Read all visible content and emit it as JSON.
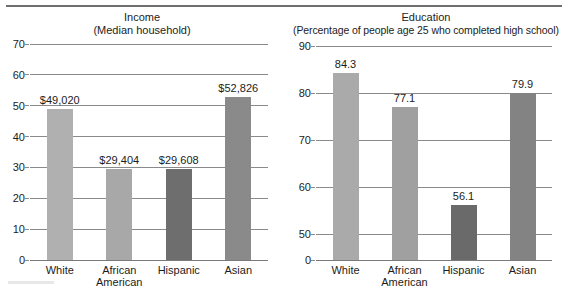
{
  "figure": {
    "top_rule": true,
    "panels": [
      "income",
      "education"
    ]
  },
  "income": {
    "title_line1": "Income",
    "title_line2": "(Median household)",
    "y_ticks": [
      "0",
      "10",
      "20",
      "30",
      "40",
      "50",
      "60",
      "70"
    ],
    "categories": [
      "White",
      "African American",
      "Hispanic",
      "Asian"
    ],
    "category_lines": [
      [
        "White"
      ],
      [
        "African",
        "American"
      ],
      [
        "Hispanic"
      ],
      [
        "Asian"
      ]
    ],
    "bar_labels": [
      "$49,020",
      "$29,404",
      "$29,608",
      "$52,826"
    ],
    "bar_colors": [
      "#b0b0b0",
      "#a8a8a8",
      "#6e6e6e",
      "#8a8a8a"
    ]
  },
  "education": {
    "title_line1": "Education",
    "title_line2": "(Percentage of people age 25 who completed high school)",
    "y_ticks": [
      "0",
      "50",
      "60",
      "70",
      "80",
      "90"
    ],
    "categories": [
      "White",
      "African American",
      "Hispanic",
      "Asian"
    ],
    "category_lines": [
      [
        "White"
      ],
      [
        "African",
        "American"
      ],
      [
        "Hispanic"
      ],
      [
        "Asian"
      ]
    ],
    "bar_labels": [
      "84.3",
      "77.1",
      "56.1",
      "79.9"
    ],
    "bar_colors": [
      "#aaaaaa",
      "#a0a0a0",
      "#6a6a6a",
      "#838383"
    ]
  },
  "chart_data": [
    {
      "type": "bar",
      "title": "Income (Median household)",
      "xlabel": "",
      "ylabel": "Thousands of dollars",
      "categories": [
        "White",
        "African American",
        "Hispanic",
        "Asian"
      ],
      "values": [
        49.02,
        29.404,
        29.608,
        52.826
      ],
      "value_labels": [
        "$49,020",
        "$29,404",
        "$29,608",
        "$52,826"
      ],
      "ylim": [
        0,
        70
      ],
      "ytick_values": [
        0,
        10,
        20,
        30,
        40,
        50,
        60,
        70
      ],
      "grid": true,
      "legend": "none",
      "broken_axis": false
    },
    {
      "type": "bar",
      "title": "Education (Percentage of people age 25 who completed high school)",
      "xlabel": "",
      "ylabel": "Percent",
      "categories": [
        "White",
        "African American",
        "Hispanic",
        "Asian"
      ],
      "values": [
        84.3,
        77.1,
        56.1,
        79.9
      ],
      "value_labels": [
        "84.3",
        "77.1",
        "56.1",
        "79.9"
      ],
      "ylim": [
        0,
        90
      ],
      "ytick_values": [
        0,
        50,
        60,
        70,
        80,
        90
      ],
      "grid": true,
      "legend": "none",
      "broken_axis": true,
      "broken_axis_note": "axis jumps from 0 directly to 50"
    }
  ]
}
